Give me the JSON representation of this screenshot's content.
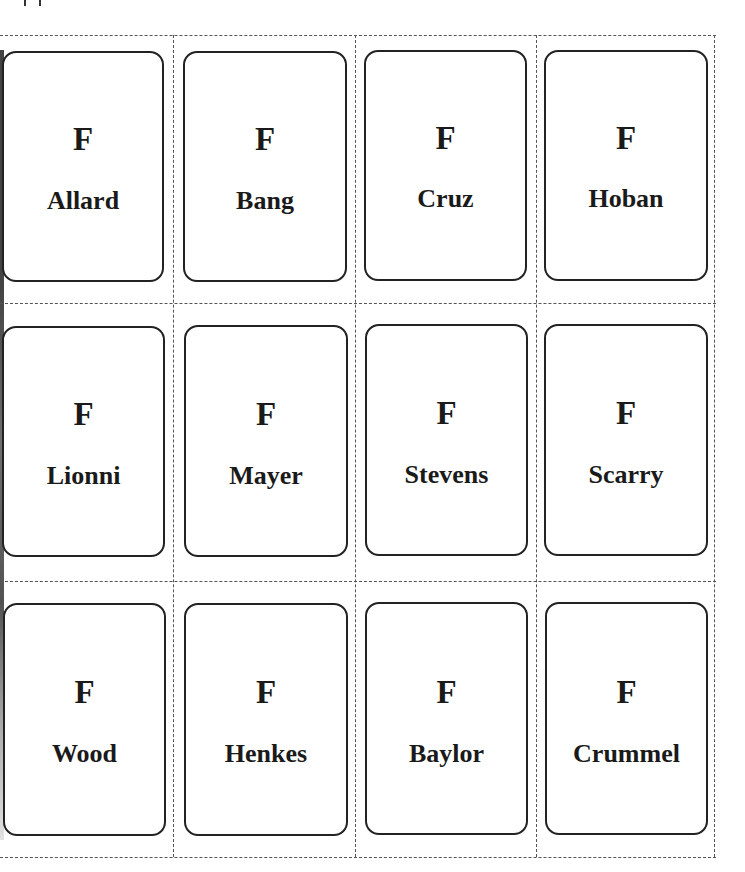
{
  "page": {
    "accent_colors": {
      "card_border": "#222222",
      "cut_line": "#555555",
      "text": "#1a1a1a"
    }
  },
  "grid": {
    "rows": 3,
    "columns": 4,
    "cards": [
      {
        "letter": "F",
        "name": "Allard"
      },
      {
        "letter": "F",
        "name": "Bang"
      },
      {
        "letter": "F",
        "name": "Cruz"
      },
      {
        "letter": "F",
        "name": "Hoban"
      },
      {
        "letter": "F",
        "name": "Lionni"
      },
      {
        "letter": "F",
        "name": "Mayer"
      },
      {
        "letter": "F",
        "name": "Stevens"
      },
      {
        "letter": "F",
        "name": "Scarry"
      },
      {
        "letter": "F",
        "name": "Wood"
      },
      {
        "letter": "F",
        "name": "Henkes"
      },
      {
        "letter": "F",
        "name": "Baylor"
      },
      {
        "letter": "F",
        "name": "Crummel"
      }
    ]
  }
}
